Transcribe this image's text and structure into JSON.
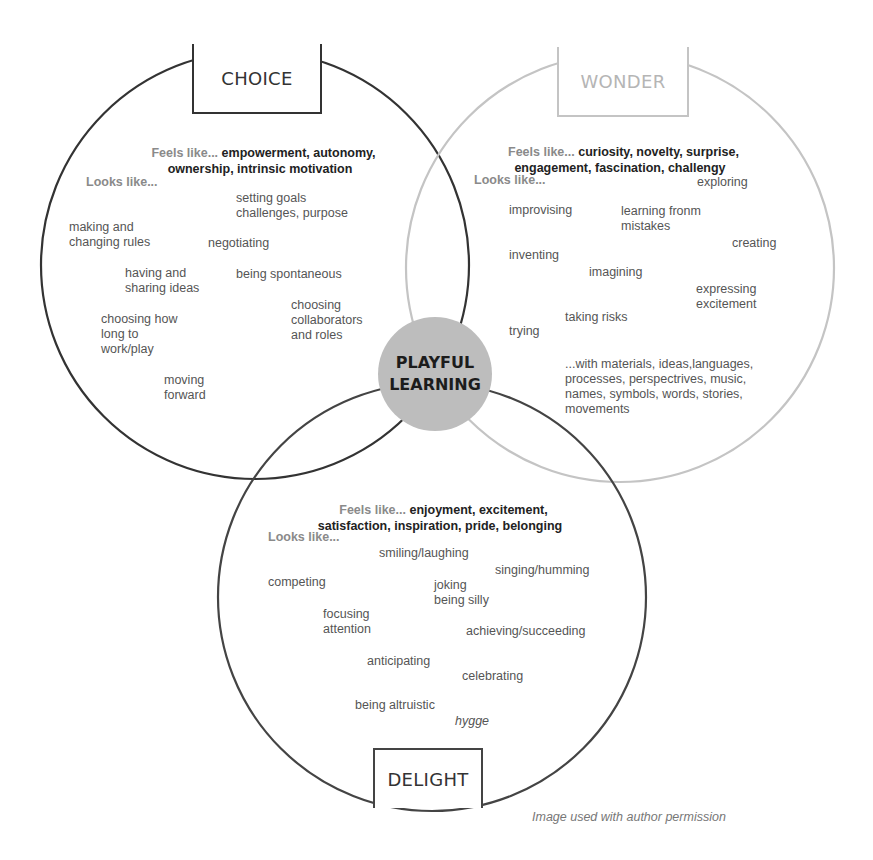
{
  "colors": {
    "choice_stroke": "#333333",
    "wonder_stroke": "#c4c4c4",
    "delight_stroke": "#444444",
    "center_fill": "#bdbdbd",
    "feels_label": "#8a8a8a",
    "feels_values": "#222222",
    "item_text": "#555555"
  },
  "center": {
    "line1": "PLAYFUL",
    "line2": "LEARNING"
  },
  "choice": {
    "title": "CHOICE",
    "feels_label": "Feels like...",
    "feels_line1": "empowerment, autonomy,",
    "feels_line2": "ownership, intrinsic motivation",
    "looks_label": "Looks like...",
    "items": [
      "setting goals\nchallenges, purpose",
      "making and\nchanging rules",
      "negotiating",
      "having and\nsharing ideas",
      "being spontaneous",
      "choosing\ncollaborators\nand roles",
      "choosing how\nlong to\nwork/play",
      "moving\nforward"
    ]
  },
  "wonder": {
    "title": "WONDER",
    "feels_label": "Feels like...",
    "feels_line1": "curiosity, novelty, surprise,",
    "feels_line2": "engagement, fascination, challengy",
    "looks_label": "Looks like...",
    "items": [
      "exploring",
      "improvising",
      "learning fronm\nmistakes",
      "creating",
      "inventing",
      "imagining",
      "expressing\nexcitement",
      "taking risks",
      "trying",
      "...with materials, ideas,languages,\nprocesses, perspectrives, music,\nnames, symbols, words, stories,\nmovements"
    ]
  },
  "delight": {
    "title": "DELIGHT",
    "feels_label": "Feels like...",
    "feels_line1": "enjoyment, excitement,",
    "feels_line2": "satisfaction, inspiration, pride, belonging",
    "looks_label": "Looks like...",
    "items": [
      "smiling/laughing",
      "singing/humming",
      "competing",
      "joking\nbeing silly",
      "focusing\nattention",
      "achieving/succeeding",
      "anticipating",
      "celebrating",
      "being altruistic",
      "hygge"
    ]
  },
  "caption": "Image used with author permission"
}
